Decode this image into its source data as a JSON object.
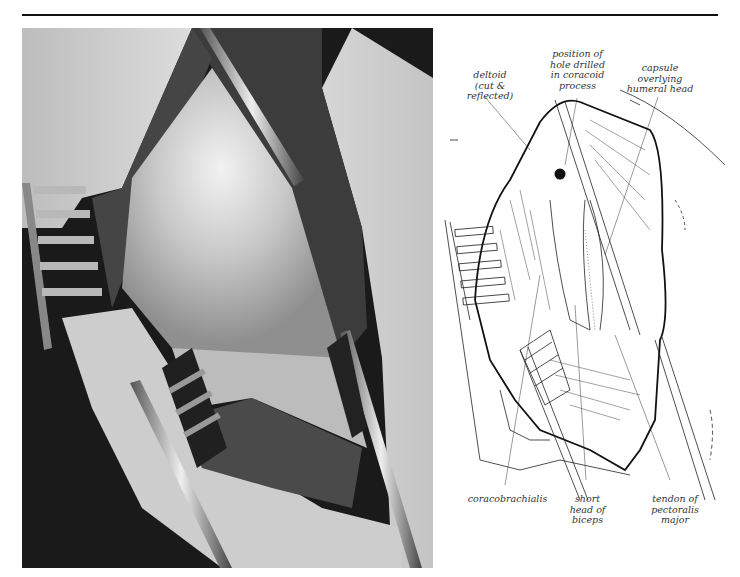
{
  "figure": {
    "photo_alt": "Intraoperative photograph of shoulder exposure with retractors",
    "labels_top": [
      {
        "id": "deltoid",
        "text": "deltoid\n(cut & reflected)"
      },
      {
        "id": "hole",
        "text": "position of\nhole drilled\nin coracoid\nprocess"
      },
      {
        "id": "capsule",
        "text": "capsule\noverlying\nhumeral head"
      }
    ],
    "labels_bottom": [
      {
        "id": "coracobrachialis",
        "text": "coracobrachialis"
      },
      {
        "id": "short-head",
        "text": "short\nhead of\nbiceps"
      },
      {
        "id": "pectoralis",
        "text": "tendon of\npectoralis\nmajor"
      }
    ]
  },
  "colors": {
    "rule": "#111111",
    "ink": "#222222",
    "label": "#333333",
    "photo_dark": "#1a1a1a",
    "photo_skin": "#cfcfcf",
    "photo_muscle": "#4a4a4a"
  }
}
